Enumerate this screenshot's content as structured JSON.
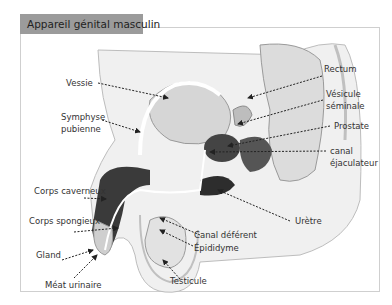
{
  "title": "Appareil génital masculin",
  "labels": {
    "vessie": "Vessie",
    "symphyse_1": "Symphyse",
    "symphyse_2": "pubienne",
    "corps_caverneux": "Corps caverneux",
    "corps_spongieux": "Corps spongieux",
    "gland": "Gland",
    "meat_urinaire": "Méat urinaire",
    "rectum": "Rectum",
    "vesicule_1": "Vésicule",
    "vesicule_2": "séminale",
    "prostate": "Prostate",
    "canal_ejac_1": "canal",
    "canal_ejac_2": "éjaculateur",
    "uretre": "Urètre",
    "canal_deferent": "Canal déférent",
    "epididyme": "Épididyme",
    "testicule": "Testicule"
  },
  "colors": {
    "title_bg": "#9b9b9b",
    "frame_border": "#cfcfcf",
    "tissue_light": "#e6e6e6",
    "tissue_mid": "#c8c8c8",
    "tissue_dark": "#3a3a3a",
    "outline": "#9a9a9a"
  }
}
